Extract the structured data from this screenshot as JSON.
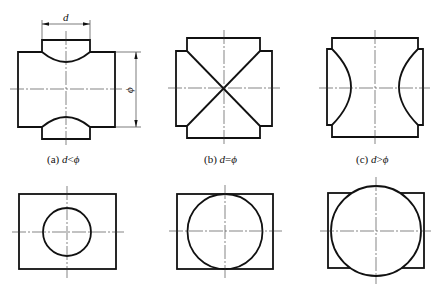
{
  "figures": [
    {
      "id": "a",
      "caption_prefix": "(a) ",
      "caption_var": "d",
      "caption_op": "<",
      "caption_var2": "ϕ",
      "dimension_d_label": "d",
      "dimension_phi_label": "ϕ"
    },
    {
      "id": "b",
      "caption_prefix": "(b) ",
      "caption_var": "d",
      "caption_op": "=",
      "caption_var2": "ϕ"
    },
    {
      "id": "c",
      "caption_prefix": "(c) ",
      "caption_var": "d",
      "caption_op": ">",
      "caption_var2": "ϕ"
    }
  ],
  "bottom_row": [
    {
      "id": "a-bottom",
      "description": "small circle inside rectangle"
    },
    {
      "id": "b-bottom",
      "description": "circle tangent to rectangle top and bottom"
    },
    {
      "id": "c-bottom",
      "description": "circle larger than rectangle height"
    }
  ],
  "colors": {
    "line": "#111111",
    "background": "#ffffff"
  }
}
